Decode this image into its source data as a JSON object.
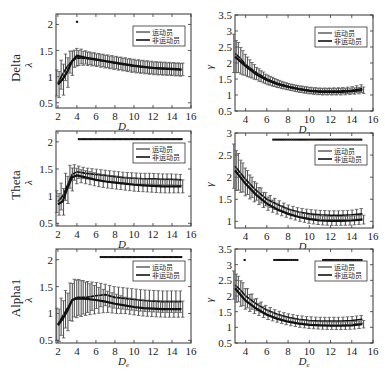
{
  "figure": {
    "legend": {
      "series_a": "运动员",
      "series_b": "非运动员"
    },
    "row_labels": [
      "Delta",
      "Theta",
      "Alpha1"
    ],
    "xlabel": "D_e"
  },
  "chart_data": [
    {
      "type": "line",
      "row": "Delta",
      "panel": "lambda",
      "title": "",
      "xlabel": "De",
      "ylabel": "λ",
      "xlim": [
        1.8,
        16
      ],
      "ylim": [
        0.4,
        2.2
      ],
      "xticks": [
        2,
        4,
        6,
        8,
        10,
        12,
        14,
        16
      ],
      "yticks": [
        0.5,
        1,
        1.5,
        2
      ],
      "legend": [
        "运动员",
        "非运动员"
      ],
      "legend_position": "upper right",
      "x": [
        2,
        2.5,
        3,
        3.5,
        4,
        5,
        6,
        7,
        8,
        9,
        10,
        11,
        12,
        13,
        14,
        15
      ],
      "series": [
        {
          "name": "运动员",
          "values": [
            0.88,
            1.05,
            1.2,
            1.3,
            1.36,
            1.35,
            1.32,
            1.29,
            1.26,
            1.23,
            1.2,
            1.18,
            1.16,
            1.15,
            1.14,
            1.13
          ],
          "err": [
            0.25,
            0.28,
            0.25,
            0.2,
            0.15,
            0.13,
            0.12,
            0.12,
            0.12,
            0.12,
            0.12,
            0.12,
            0.12,
            0.12,
            0.12,
            0.12
          ]
        },
        {
          "name": "非运动员",
          "values": [
            0.85,
            0.95,
            1.1,
            1.3,
            1.4,
            1.36,
            1.33,
            1.3,
            1.27,
            1.24,
            1.21,
            1.19,
            1.17,
            1.16,
            1.15,
            1.14
          ],
          "err": [
            0.25,
            0.3,
            0.28,
            0.22,
            0.15,
            0.12,
            0.12,
            0.12,
            0.12,
            0.12,
            0.12,
            0.12,
            0.12,
            0.12,
            0.12,
            0.12
          ]
        }
      ],
      "significance_marks": {
        "y": 2.05,
        "x": [
          4
        ]
      }
    },
    {
      "type": "line",
      "row": "Delta",
      "panel": "gamma",
      "title": "",
      "xlabel": "De",
      "ylabel": "γ",
      "xlim": [
        3,
        16
      ],
      "ylim": [
        0.5,
        3.5
      ],
      "xticks": [
        4,
        6,
        8,
        10,
        12,
        14,
        16
      ],
      "yticks": [
        0.5,
        1,
        1.5,
        2,
        2.5,
        3,
        3.5
      ],
      "legend": [
        "运动员",
        "非运动员"
      ],
      "legend_position": "upper right",
      "x": [
        3,
        3.5,
        4,
        5,
        6,
        7,
        8,
        9,
        10,
        11,
        12,
        13,
        14,
        15
      ],
      "series": [
        {
          "name": "运动员",
          "values": [
            2.3,
            2.15,
            1.95,
            1.7,
            1.5,
            1.37,
            1.27,
            1.2,
            1.15,
            1.12,
            1.12,
            1.13,
            1.15,
            1.2
          ],
          "err": [
            0.6,
            0.45,
            0.35,
            0.2,
            0.15,
            0.12,
            0.1,
            0.1,
            0.1,
            0.1,
            0.1,
            0.1,
            0.1,
            0.12
          ]
        },
        {
          "name": "非运动员",
          "values": [
            2.2,
            2.05,
            1.9,
            1.65,
            1.47,
            1.34,
            1.25,
            1.18,
            1.13,
            1.1,
            1.1,
            1.1,
            1.12,
            1.15
          ],
          "err": [
            0.5,
            0.4,
            0.3,
            0.2,
            0.15,
            0.12,
            0.1,
            0.1,
            0.1,
            0.1,
            0.1,
            0.1,
            0.1,
            0.1
          ]
        }
      ],
      "significance_marks": {
        "y": null,
        "x": []
      }
    },
    {
      "type": "line",
      "row": "Theta",
      "panel": "lambda",
      "title": "",
      "xlabel": "De",
      "ylabel": "λ",
      "xlim": [
        1.8,
        16
      ],
      "ylim": [
        0.45,
        2.2
      ],
      "xticks": [
        2,
        4,
        6,
        8,
        10,
        12,
        14,
        16
      ],
      "yticks": [
        0.5,
        1,
        1.5,
        2
      ],
      "legend": [
        "运动员",
        "非运动员"
      ],
      "legend_position": "upper right",
      "x": [
        2,
        2.5,
        3,
        3.5,
        4,
        5,
        6,
        7,
        8,
        9,
        10,
        11,
        12,
        13,
        14,
        15
      ],
      "series": [
        {
          "name": "运动员",
          "values": [
            0.9,
            1.0,
            1.2,
            1.4,
            1.45,
            1.42,
            1.4,
            1.38,
            1.36,
            1.34,
            1.33,
            1.32,
            1.32,
            1.31,
            1.31,
            1.3
          ],
          "err": [
            0.2,
            0.25,
            0.25,
            0.2,
            0.12,
            0.1,
            0.1,
            0.1,
            0.1,
            0.1,
            0.1,
            0.1,
            0.1,
            0.1,
            0.1,
            0.1
          ]
        },
        {
          "name": "非运动员",
          "values": [
            0.85,
            0.9,
            1.15,
            1.35,
            1.38,
            1.34,
            1.3,
            1.27,
            1.25,
            1.23,
            1.21,
            1.2,
            1.19,
            1.18,
            1.18,
            1.18
          ],
          "err": [
            0.2,
            0.25,
            0.25,
            0.2,
            0.12,
            0.12,
            0.12,
            0.12,
            0.12,
            0.12,
            0.12,
            0.12,
            0.12,
            0.12,
            0.12,
            0.12
          ]
        }
      ],
      "significance_marks": {
        "y": 2.05,
        "x_range": [
          4.2,
          15
        ]
      }
    },
    {
      "type": "line",
      "row": "Theta",
      "panel": "gamma",
      "title": "",
      "xlabel": "De",
      "ylabel": "γ",
      "xlim": [
        3,
        16
      ],
      "ylim": [
        0.85,
        3
      ],
      "xticks": [
        4,
        6,
        8,
        10,
        12,
        14,
        16
      ],
      "yticks": [
        1,
        1.5,
        2,
        2.5,
        3
      ],
      "legend": [
        "运动员",
        "非运动员"
      ],
      "legend_position": "upper right",
      "x": [
        3,
        3.5,
        4,
        5,
        6,
        7,
        8,
        9,
        10,
        11,
        12,
        13,
        14,
        15
      ],
      "series": [
        {
          "name": "运动员",
          "values": [
            2.25,
            2.1,
            1.95,
            1.7,
            1.5,
            1.38,
            1.28,
            1.21,
            1.17,
            1.15,
            1.14,
            1.14,
            1.15,
            1.17
          ],
          "err": [
            0.5,
            0.4,
            0.3,
            0.2,
            0.15,
            0.12,
            0.1,
            0.1,
            0.1,
            0.1,
            0.1,
            0.1,
            0.1,
            0.12
          ]
        },
        {
          "name": "非运动员",
          "values": [
            2.15,
            2.0,
            1.85,
            1.6,
            1.4,
            1.27,
            1.17,
            1.1,
            1.05,
            1.02,
            1.01,
            1.01,
            1.02,
            1.04
          ],
          "err": [
            0.45,
            0.35,
            0.3,
            0.2,
            0.15,
            0.12,
            0.1,
            0.1,
            0.1,
            0.1,
            0.1,
            0.1,
            0.1,
            0.1
          ]
        }
      ],
      "significance_marks": {
        "y": 2.85,
        "x_range": [
          6.6,
          15
        ]
      }
    },
    {
      "type": "line",
      "row": "Alpha1",
      "panel": "lambda",
      "title": "",
      "xlabel": "De",
      "ylabel": "λ",
      "xlim": [
        1.8,
        16
      ],
      "ylim": [
        0.45,
        2.2
      ],
      "xticks": [
        2,
        4,
        6,
        8,
        10,
        12,
        14,
        16
      ],
      "yticks": [
        0.5,
        1,
        1.5,
        2
      ],
      "legend": [
        "运动员",
        "非运动员"
      ],
      "legend_position": "upper right",
      "x": [
        2,
        2.5,
        3,
        3.5,
        4,
        5,
        6,
        7,
        8,
        9,
        10,
        11,
        12,
        13,
        14,
        15
      ],
      "series": [
        {
          "name": "运动员",
          "values": [
            0.8,
            0.95,
            1.1,
            1.25,
            1.3,
            1.3,
            1.33,
            1.35,
            1.3,
            1.28,
            1.26,
            1.24,
            1.23,
            1.22,
            1.22,
            1.22
          ],
          "err": [
            0.3,
            0.35,
            0.35,
            0.35,
            0.35,
            0.3,
            0.25,
            0.2,
            0.2,
            0.2,
            0.2,
            0.2,
            0.2,
            0.2,
            0.2,
            0.2
          ]
        },
        {
          "name": "非运动员",
          "values": [
            0.78,
            0.9,
            1.05,
            1.25,
            1.28,
            1.27,
            1.25,
            1.22,
            1.18,
            1.15,
            1.12,
            1.1,
            1.09,
            1.08,
            1.08,
            1.08
          ],
          "err": [
            0.3,
            0.35,
            0.35,
            0.35,
            0.35,
            0.3,
            0.25,
            0.2,
            0.18,
            0.15,
            0.15,
            0.15,
            0.15,
            0.15,
            0.15,
            0.15
          ]
        }
      ],
      "significance_marks": {
        "y": 2.05,
        "x_range": [
          6.5,
          15
        ]
      }
    },
    {
      "type": "line",
      "row": "Alpha1",
      "panel": "gamma",
      "title": "",
      "xlabel": "De",
      "ylabel": "γ",
      "xlim": [
        3,
        16
      ],
      "ylim": [
        0.5,
        3.5
      ],
      "xticks": [
        4,
        6,
        8,
        10,
        12,
        14,
        16
      ],
      "yticks": [
        0.5,
        1,
        1.5,
        2,
        2.5,
        3,
        3.5
      ],
      "legend": [
        "运动员",
        "非运动员"
      ],
      "legend_position": "upper right",
      "x": [
        3,
        3.5,
        4,
        5,
        6,
        7,
        8,
        9,
        10,
        11,
        12,
        13,
        14,
        15
      ],
      "series": [
        {
          "name": "运动员",
          "values": [
            2.35,
            2.2,
            2.0,
            1.75,
            1.55,
            1.42,
            1.32,
            1.26,
            1.22,
            1.2,
            1.2,
            1.2,
            1.22,
            1.26
          ],
          "err": [
            0.45,
            0.4,
            0.35,
            0.2,
            0.15,
            0.12,
            0.12,
            0.12,
            0.12,
            0.12,
            0.12,
            0.12,
            0.12,
            0.12
          ]
        },
        {
          "name": "非运动员",
          "values": [
            2.25,
            2.05,
            1.85,
            1.6,
            1.4,
            1.27,
            1.18,
            1.12,
            1.08,
            1.06,
            1.05,
            1.05,
            1.06,
            1.1
          ],
          "err": [
            0.45,
            0.4,
            0.3,
            0.2,
            0.15,
            0.12,
            0.12,
            0.12,
            0.12,
            0.12,
            0.12,
            0.12,
            0.12,
            0.12
          ]
        }
      ],
      "significance_marks": {
        "y": 3.15,
        "x": [
          3.9
        ],
        "x_ranges": [
          [
            6.7,
            9.0
          ],
          [
            11.3,
            15
          ]
        ]
      }
    }
  ]
}
